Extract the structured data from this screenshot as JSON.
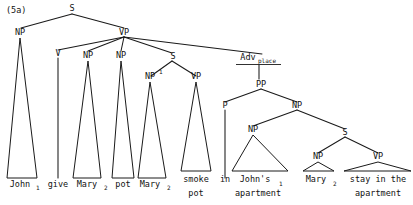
{
  "figure": {
    "number": "(5a)",
    "caption_note": "",
    "ink_color": "#1a1a1a",
    "background_color": "#ffffff"
  },
  "nodes": {
    "root_s": "S",
    "subject_np": "NP",
    "main_vp": "VP",
    "verb_v": "V",
    "obj_np1": "NP",
    "obj_np2": "NP",
    "embedded_s": "S",
    "embedded_np1_base": "NP",
    "embedded_np1_sup": "1",
    "embedded_vp": "VP",
    "adv_base": "Adv",
    "adv_sub": "place",
    "pp": "PP",
    "p": "P",
    "pp_np": "NP",
    "poss_np": "NP",
    "inner_s": "S",
    "inner_np": "NP",
    "inner_vp": "VP"
  },
  "leaves": {
    "john": {
      "word": "John",
      "index": "1"
    },
    "give": {
      "word": "give",
      "index": ""
    },
    "mary_obj": {
      "word": "Mary",
      "index": "2"
    },
    "pot": {
      "word": "pot",
      "index": ""
    },
    "mary_subj": {
      "word": "Mary",
      "index": "2"
    },
    "smoke_pot_line1": "smoke",
    "smoke_pot_line2": "pot",
    "in": "in",
    "johns_apartment_line1": "John's",
    "johns_apartment_index": "1",
    "johns_apartment_line2": "apartment",
    "mary_inner": {
      "word": "Mary",
      "index": "2"
    },
    "stay_line1": "stay in the",
    "stay_line2": "apartment"
  }
}
